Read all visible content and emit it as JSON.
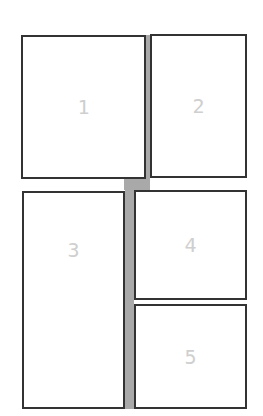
{
  "layout": {
    "panels": [
      {
        "label": "1"
      },
      {
        "label": "2"
      },
      {
        "label": "3"
      },
      {
        "label": "4"
      },
      {
        "label": "5"
      }
    ]
  },
  "colors": {
    "border": "#333333",
    "gutter": "#a9a9a9",
    "label": "#cfcfcf"
  }
}
